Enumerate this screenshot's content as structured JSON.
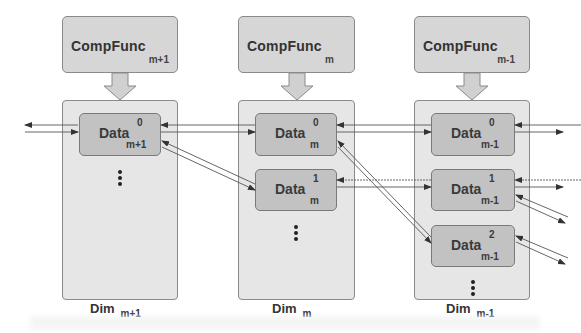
{
  "columns": [
    {
      "func": {
        "name": "CompFunc",
        "sub": "m+1"
      },
      "dim": {
        "name": "Dim",
        "sub": "m+1"
      },
      "data": [
        {
          "name": "Data",
          "sup": "0",
          "sub": "m+1"
        }
      ]
    },
    {
      "func": {
        "name": "CompFunc",
        "sub": "m"
      },
      "dim": {
        "name": "Dim",
        "sub": "m"
      },
      "data": [
        {
          "name": "Data",
          "sup": "0",
          "sub": "m"
        },
        {
          "name": "Data",
          "sup": "1",
          "sub": "m"
        }
      ]
    },
    {
      "func": {
        "name": "CompFunc",
        "sub": "m-1"
      },
      "dim": {
        "name": "Dim",
        "sub": "m-1"
      },
      "data": [
        {
          "name": "Data",
          "sup": "0",
          "sub": "m-1"
        },
        {
          "name": "Data",
          "sup": "1",
          "sub": "m-1"
        },
        {
          "name": "Data",
          "sup": "2",
          "sub": "m-1"
        }
      ]
    }
  ],
  "colors": {
    "box_border": "#8a8a8a",
    "func_fill": "#c9c9c9",
    "dim_fill": "#e0e0e0",
    "data_fill": "#c2c2c2",
    "arrow": "#333333"
  }
}
